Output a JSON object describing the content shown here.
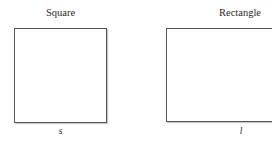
{
  "figure": {
    "background_color": "#ffffff",
    "stroke_color": "#565656",
    "shadow_color": "#c9c9c9",
    "text_color": "#2b2b2b",
    "shapes": [
      {
        "name": "square",
        "title": "Square",
        "dimension_label": "s"
      },
      {
        "name": "rectangle",
        "title": "Rectangle",
        "dimension_label": "l"
      }
    ]
  }
}
